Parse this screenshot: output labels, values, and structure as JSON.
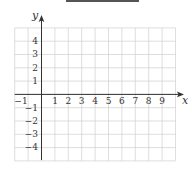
{
  "header": {
    "bar_color": "#555555"
  },
  "chart_data": {
    "type": "grid",
    "title": "",
    "xlabel": "x",
    "ylabel": "y",
    "xlim": [
      -2,
      10
    ],
    "ylim": [
      -5,
      5
    ],
    "x_ticks": [
      "-1",
      "1",
      "2",
      "3",
      "4",
      "5",
      "6",
      "7",
      "8",
      "9"
    ],
    "x_tick_values": [
      -1,
      1,
      2,
      3,
      4,
      5,
      6,
      7,
      8,
      9
    ],
    "y_ticks": [
      "4",
      "3",
      "2",
      "1",
      "-1",
      "-2",
      "-3",
      "-4"
    ],
    "y_tick_values": [
      4,
      3,
      2,
      1,
      -1,
      -2,
      -3,
      -4
    ],
    "grid": true,
    "grid_color": "#d0d0d0",
    "axis_color": "#333333",
    "series": []
  },
  "labels": {
    "x_axis": "x",
    "y_axis": "y",
    "x_ticks": [
      "−1",
      "1",
      "2",
      "3",
      "4",
      "5",
      "6",
      "7",
      "8",
      "9"
    ],
    "y_ticks": [
      "4",
      "3",
      "2",
      "1",
      "−1",
      "−2",
      "−3",
      "−4"
    ]
  }
}
